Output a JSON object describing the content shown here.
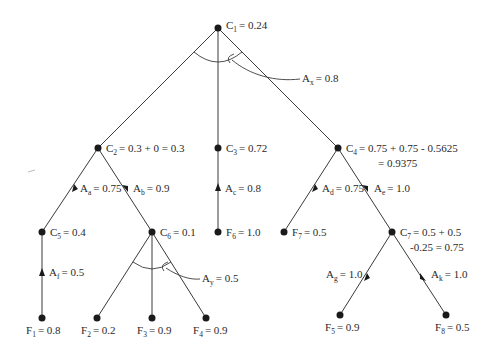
{
  "diagram": {
    "type": "and-or certainty-factor tree",
    "nodes": [
      {
        "id": "C1",
        "base": "C",
        "sub": "1",
        "value_text": "= 0.24"
      },
      {
        "id": "C2",
        "base": "C",
        "sub": "2",
        "value_text": "= 0.3 + 0 = 0.3"
      },
      {
        "id": "C3",
        "base": "C",
        "sub": "3",
        "value_text": "= 0.72"
      },
      {
        "id": "C4",
        "base": "C",
        "sub": "4",
        "value_text": "= 0.75 + 0.75 - 0.5625",
        "value_text_2": "= 0.9375"
      },
      {
        "id": "C5",
        "base": "C",
        "sub": "5",
        "value_text": "= 0.4"
      },
      {
        "id": "C6",
        "base": "C",
        "sub": "6",
        "value_text": "= 0.1"
      },
      {
        "id": "C7",
        "base": "C",
        "sub": "7",
        "value_text": "= 0.5 + 0.5",
        "value_text_2": "-0.25 = 0.75"
      },
      {
        "id": "F1",
        "base": "F",
        "sub": "1",
        "value_text": "= 0.8"
      },
      {
        "id": "F2",
        "base": "F",
        "sub": "2",
        "value_text": "= 0.2"
      },
      {
        "id": "F3",
        "base": "F",
        "sub": "3",
        "value_text": "= 0.9"
      },
      {
        "id": "F4",
        "base": "F",
        "sub": "4",
        "value_text": "= 0.9"
      },
      {
        "id": "F5",
        "base": "F",
        "sub": "5",
        "value_text": "= 0.9"
      },
      {
        "id": "F6",
        "base": "F",
        "sub": "6",
        "value_text": "= 1.0"
      },
      {
        "id": "F7",
        "base": "F",
        "sub": "7",
        "value_text": "= 0.5"
      },
      {
        "id": "F8",
        "base": "F",
        "sub": "8",
        "value_text": "= 0.5"
      }
    ],
    "rules": [
      {
        "id": "Ax",
        "base": "A",
        "sub": "x",
        "value_text": "= 0.8",
        "type": "and",
        "from": [
          "C2",
          "C3",
          "C4"
        ],
        "to": "C1"
      },
      {
        "id": "Aa",
        "base": "A",
        "sub": "a",
        "value_text": "= 0.75",
        "from": [
          "C5"
        ],
        "to": "C2"
      },
      {
        "id": "Ab",
        "base": "A",
        "sub": "b",
        "value_text": "= 0.9",
        "from": [
          "C6"
        ],
        "to": "C2"
      },
      {
        "id": "Ac",
        "base": "A",
        "sub": "c",
        "value_text": "= 0.8",
        "from": [
          "F5"
        ],
        "to": "C3"
      },
      {
        "id": "Ad",
        "base": "A",
        "sub": "d",
        "value_text": "= 0.75",
        "from": [
          "F6"
        ],
        "to": "C4"
      },
      {
        "id": "Ae",
        "base": "A",
        "sub": "e",
        "value_text": "= 1.0",
        "from": [
          "C7"
        ],
        "to": "C4"
      },
      {
        "id": "Af",
        "base": "A",
        "sub": "f",
        "value_text": "= 0.5",
        "from": [
          "F1"
        ],
        "to": "C5"
      },
      {
        "id": "Ay",
        "base": "A",
        "sub": "y",
        "value_text": "= 0.5",
        "type": "and",
        "from": [
          "F2",
          "F3",
          "F4"
        ],
        "to": "C6"
      },
      {
        "id": "Ag",
        "base": "A",
        "sub": "g",
        "value_text": "= 1.0",
        "from": [
          "F7"
        ],
        "to": "C7"
      },
      {
        "id": "Ak",
        "base": "A",
        "sub": "k",
        "value_text": "= 1.0",
        "from": [
          "F8"
        ],
        "to": "C7"
      }
    ]
  }
}
